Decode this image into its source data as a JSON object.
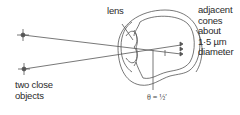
{
  "diagram": {
    "labels": {
      "lens": "lens",
      "cones": [
        "adjacent",
        "cones",
        "about",
        "1·5 µm",
        "diameter"
      ],
      "objects": [
        "two close",
        "objects"
      ],
      "angle": "θ = ½′"
    },
    "elements": {
      "objects": [
        {
          "name": "upper-object",
          "x": 23,
          "y": 35
        },
        {
          "name": "lower-object",
          "x": 24,
          "y": 69
        }
      ],
      "cones_count": 3
    },
    "colors": {
      "line": "#555555",
      "text": "#2a2a2a",
      "background": "#ffffff"
    }
  }
}
